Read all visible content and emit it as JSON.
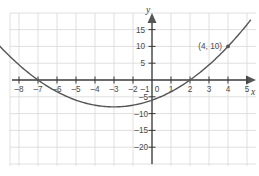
{
  "chart_data": {
    "type": "line",
    "title": "",
    "xlabel": "x",
    "ylabel": "y",
    "xlim": [
      -8.9,
      5.6
    ],
    "ylim": [
      -23.5,
      17.5
    ],
    "grid": true,
    "legend": null,
    "x_ticks": [
      -8,
      -7,
      -6,
      -5,
      -4,
      -3,
      -2,
      -1,
      0,
      1,
      2,
      3,
      4,
      5
    ],
    "x_tick_labels": [
      "–8",
      "–7",
      "–6",
      "–5",
      "–4",
      "–3",
      "–2",
      "–1",
      "0",
      "1",
      "2",
      "3",
      "4",
      "5"
    ],
    "y_ticks": [
      15,
      10,
      5,
      -5,
      -10,
      -15,
      -20
    ],
    "y_tick_labels": [
      "15",
      "10",
      "5",
      "–5",
      "–10",
      "–15",
      "–20"
    ],
    "series": [
      {
        "name": "parabola",
        "equation": "y = (x + 6)(x - 2) / 2",
        "color": "#555555",
        "x": [
          -8.6,
          -8,
          -7,
          -6,
          -5,
          -4,
          -3,
          -2,
          -1,
          0,
          1,
          2,
          3,
          4,
          5,
          5.2
        ],
        "y": [
          15.98,
          10.0,
          4.5,
          0.0,
          -3.5,
          -6.0,
          -7.5,
          -8.0,
          -7.5,
          -6.0,
          -3.5,
          0.0,
          4.5,
          10.0,
          16.5,
          17.76
        ],
        "roots": [
          -6,
          2
        ],
        "vertex": [
          -2,
          -8
        ]
      }
    ],
    "annotations": [
      {
        "name": "labeled-point",
        "label": "(4, 10)",
        "x": 4,
        "y": 10,
        "marker": "dot"
      }
    ],
    "axis_colors": {
      "axis": "#3a3a3a",
      "grid": "#d8d8d8",
      "curve": "#555555",
      "text": "#4a4a4a"
    }
  }
}
